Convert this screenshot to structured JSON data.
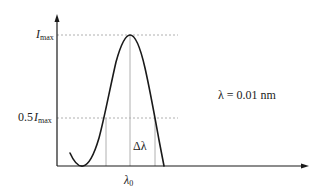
{
  "figure": {
    "type": "spectral-line-profile"
  },
  "labels": {
    "imax_symbol": "I",
    "imax_subscript": "max",
    "halfmax_prefix": "0.5",
    "halfmax_symbol": "I",
    "halfmax_subscript": "max",
    "lambda0_symbol": "λ",
    "lambda0_subscript": "0",
    "delta_lambda": "Δλ",
    "annotation": "λ = 0.01 nm"
  },
  "colors": {
    "curve": "#1a1a1a",
    "axis": "#1a1a1a",
    "guide": "#b0b0b0",
    "text": "#222222"
  }
}
